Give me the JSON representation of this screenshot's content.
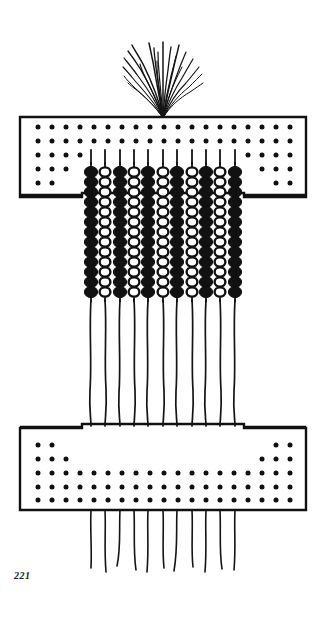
{
  "plate": {
    "number_label": "221",
    "caption_position": "bottom-left"
  },
  "page": {
    "background_color": "#ffffff",
    "ink_color": "#111111",
    "width": 326,
    "height": 628
  },
  "figure": {
    "name": "beaded-apron-artifact",
    "description_parts": [
      "tassel-fringe",
      "upper-band-panel",
      "bead-strand-field",
      "lower-band-panel",
      "hanging-string-fringe"
    ],
    "tassel": {
      "name": "tassel-fringe",
      "strand_count": 21,
      "origin_x": 163,
      "origin_y": 118,
      "spread_top_y": 42,
      "half_width": 42
    },
    "upper_band": {
      "name": "upper-band-panel",
      "x": 20,
      "y": 117,
      "width": 286,
      "height": 80,
      "border_color": "#111111",
      "fill_color": "#ffffff",
      "dot_rows": 5,
      "notch_left_width": 62,
      "notch_right_width": 62,
      "dot_pattern": "inverted-staircase-both-ends"
    },
    "lower_band": {
      "name": "lower-band-panel",
      "x": 20,
      "y": 424,
      "width": 286,
      "height": 86,
      "border_color": "#111111",
      "fill_color": "#ffffff",
      "dot_rows": 5,
      "notch_left_width": 62,
      "notch_right_width": 62,
      "dot_pattern": "staircase-both-ends"
    },
    "bead_field": {
      "name": "bead-strand-field",
      "column_count": 11,
      "first_column_x": 91,
      "column_spacing": 14.4,
      "bead_top_y": 162,
      "bead_bottom_y": 300,
      "bead_rows": 14,
      "black_color": "#111111",
      "white_color": "#ffffff",
      "columns": [
        {
          "index": 0,
          "style": "filled"
        },
        {
          "index": 1,
          "style": "outlined"
        },
        {
          "index": 2,
          "style": "filled"
        },
        {
          "index": 3,
          "style": "outlined"
        },
        {
          "index": 4,
          "style": "filled"
        },
        {
          "index": 5,
          "style": "outlined"
        },
        {
          "index": 6,
          "style": "filled"
        },
        {
          "index": 7,
          "style": "outlined"
        },
        {
          "index": 8,
          "style": "filled"
        },
        {
          "index": 9,
          "style": "outlined"
        },
        {
          "index": 10,
          "style": "filled"
        }
      ]
    },
    "strings": {
      "name": "hanging-string-fringe",
      "count": 11,
      "upper_start_y": 150,
      "middle_end_y": 424,
      "lower_start_y": 510,
      "lower_end_y": 572,
      "stroke_color": "#111111",
      "stroke_width": 1.6
    }
  }
}
